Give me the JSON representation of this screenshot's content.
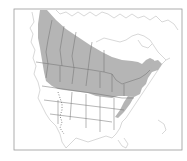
{
  "map": {
    "title": "Breeding range map",
    "region": "North America",
    "colors": {
      "range_fill": "#b5b5b5",
      "background": "#ffffff",
      "outline": "#a8a8a8",
      "frame": "#9a9a9a"
    },
    "legend": {
      "shaded": "Range"
    }
  }
}
